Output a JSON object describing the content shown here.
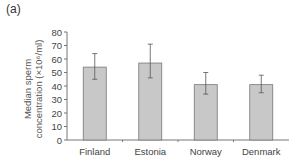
{
  "panel_label": "(a)",
  "chart_data": {
    "type": "bar",
    "title": "",
    "xlabel": "",
    "ylabel": "Median sperm concentration (×10⁶/ml)",
    "ylabel_line1": "Median sperm",
    "ylabel_line2": "concentration (×10⁶/ml)",
    "categories": [
      "Finland",
      "Estonia",
      "Norway",
      "Denmark"
    ],
    "values": [
      54,
      57,
      41,
      41
    ],
    "error_low": [
      45,
      46,
      34,
      35
    ],
    "error_high": [
      64,
      71,
      50,
      48
    ],
    "ylim": [
      0,
      80
    ],
    "yticks": [
      0,
      10,
      20,
      30,
      40,
      50,
      60,
      70,
      80
    ],
    "grid": false,
    "bar_color": "#c8c8c8",
    "bar_edge": "#777777"
  }
}
